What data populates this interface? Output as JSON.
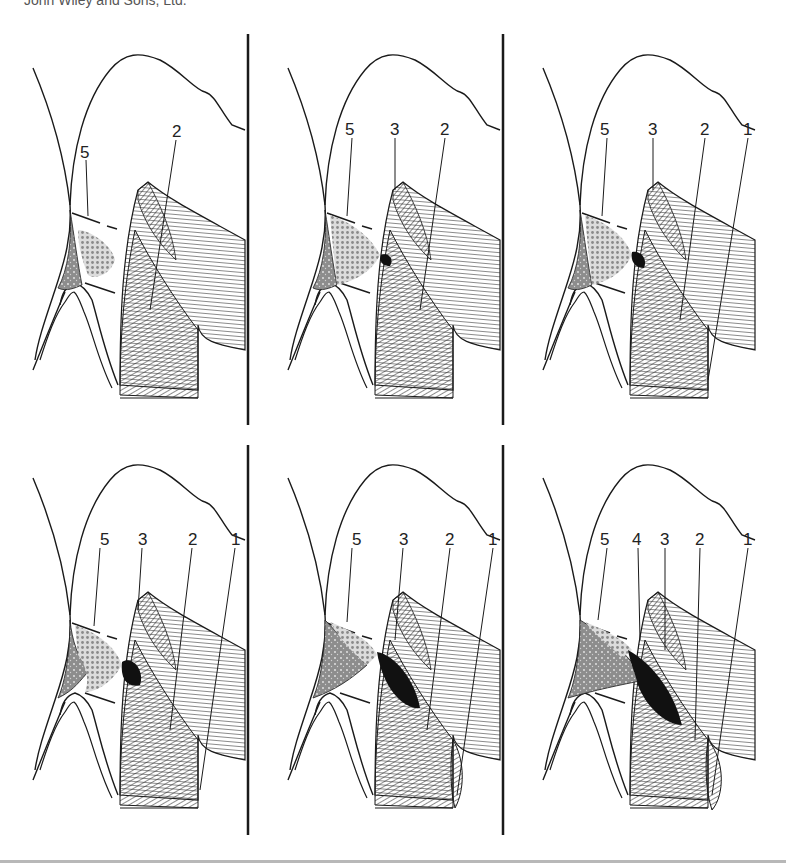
{
  "credit": "John Wiley and Sons, Ltd.",
  "colors": {
    "line": "#1a1a1a",
    "hatch": "#2a2a2a",
    "stipple": "#8a8a8a",
    "dark_mass": "#111111",
    "rule": "#b8b8b8"
  },
  "panels": [
    {
      "id": "panel-1",
      "row": 1,
      "col": 1,
      "labels": [
        "5",
        "2"
      ]
    },
    {
      "id": "panel-2",
      "row": 1,
      "col": 2,
      "labels": [
        "5",
        "3",
        "2"
      ]
    },
    {
      "id": "panel-3",
      "row": 1,
      "col": 3,
      "labels": [
        "5",
        "3",
        "2",
        "1"
      ]
    },
    {
      "id": "panel-4",
      "row": 2,
      "col": 1,
      "labels": [
        "5",
        "3",
        "2",
        "1"
      ]
    },
    {
      "id": "panel-5",
      "row": 2,
      "col": 2,
      "labels": [
        "5",
        "3",
        "2",
        "1"
      ]
    },
    {
      "id": "panel-6",
      "row": 2,
      "col": 3,
      "labels": [
        "5",
        "4",
        "3",
        "2",
        "1"
      ]
    }
  ],
  "labels": {
    "p1": {
      "l5": "5",
      "l2": "2"
    },
    "p2": {
      "l5": "5",
      "l3": "3",
      "l2": "2"
    },
    "p3": {
      "l5": "5",
      "l3": "3",
      "l2": "2",
      "l1": "1"
    },
    "p4": {
      "l5": "5",
      "l3": "3",
      "l2": "2",
      "l1": "1"
    },
    "p5": {
      "l5": "5",
      "l3": "3",
      "l2": "2",
      "l1": "1"
    },
    "p6": {
      "l5": "5",
      "l4": "4",
      "l3": "3",
      "l2": "2",
      "l1": "1"
    }
  }
}
